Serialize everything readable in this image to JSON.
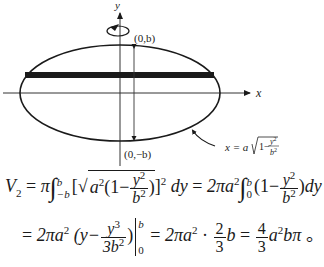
{
  "figure": {
    "axis_x_label": "x",
    "axis_y_label": "y",
    "point_top_label": "(0,b)",
    "point_bottom_label": "(0,−b)",
    "curve_label": "x = a√(1 − y²/b²)",
    "curve_label_lhs": "x = a",
    "curve_label_radicand_pre": "1−",
    "curve_label_num": "y",
    "curve_label_num_exp": "2",
    "curve_label_den": "b",
    "curve_label_den_exp": "2",
    "rotation_icon": "rotation-arrow-around-y-axis"
  },
  "equations": {
    "line1": {
      "lhs": "V",
      "lhs_sub": "2",
      "eq1": "=",
      "pi": "π",
      "lower1": "−b",
      "upper1": "b",
      "bracket_open": "[",
      "radicand_a": "a",
      "radicand_a_exp": "2",
      "paren_open": "(1−",
      "frac1_num": "y",
      "frac1_num_exp": "2",
      "frac1_den": "b",
      "frac1_den_exp": "2",
      "paren_close": ")",
      "bracket_close": "]",
      "bracket_exp": "2",
      "dy1": "dy",
      "eq2": "=",
      "coef": "2πa",
      "coef_exp": "2",
      "lower2": "0",
      "upper2": "b",
      "paren2_open": "(1−",
      "frac2_num": "y",
      "frac2_num_exp": "2",
      "frac2_den": "b",
      "frac2_den_exp": "2",
      "paren2_close": ")",
      "dy2": "dy"
    },
    "line2": {
      "eq1": "=",
      "coef": "2πa",
      "coef_exp": "2",
      "paren_open": "(y−",
      "frac_num": "y",
      "frac_num_exp": "3",
      "frac_den": "3b",
      "frac_den_exp": "2",
      "paren_close": ")",
      "eval_upper": "b",
      "eval_lower": "0",
      "eq2": "=",
      "coef2": "2πa",
      "coef2_exp": "2",
      "dot": "·",
      "frac2_num": "2",
      "frac2_den": "3",
      "b": "b",
      "eq3": "=",
      "frac3_num": "4",
      "frac3_den": "3",
      "result": "a",
      "result_exp": "2",
      "result_tail": "bπ",
      "end_mark": "。"
    }
  }
}
